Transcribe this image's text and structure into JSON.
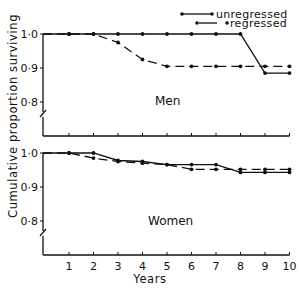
{
  "chart_data": [
    {
      "type": "line",
      "title": "Men",
      "xlabel": "Years",
      "ylabel": "Cumulative proportion surviving",
      "x": [
        1,
        2,
        3,
        4,
        5,
        6,
        7,
        8,
        9,
        10
      ],
      "xticks": [
        "1",
        "2",
        "3",
        "4",
        "5",
        "6",
        "7",
        "8",
        "9",
        "10"
      ],
      "yticks": [
        "0·8",
        "0·9",
        "1·0"
      ],
      "ylim": [
        0.8,
        1.0
      ],
      "axis_break": true,
      "grid": false,
      "series": [
        {
          "name": "unregressed",
          "style": "solid",
          "values": [
            1.0,
            1.0,
            1.0,
            1.0,
            1.0,
            1.0,
            1.0,
            1.0,
            0.885,
            0.885
          ]
        },
        {
          "name": "regressed",
          "style": "dash-dot",
          "values": [
            1.0,
            1.0,
            0.975,
            0.925,
            0.905,
            0.905,
            0.905,
            0.905,
            0.905,
            0.905
          ]
        }
      ]
    },
    {
      "type": "line",
      "title": "Women",
      "xlabel": "Years",
      "ylabel": "Cumulative proportion surviving",
      "x": [
        1,
        2,
        3,
        4,
        5,
        6,
        7,
        8,
        9,
        10
      ],
      "xticks": [
        "1",
        "2",
        "3",
        "4",
        "5",
        "6",
        "7",
        "8",
        "9",
        "10"
      ],
      "yticks": [
        "0·8",
        "0·9",
        "1·0"
      ],
      "ylim": [
        0.8,
        1.0
      ],
      "axis_break": true,
      "grid": false,
      "series": [
        {
          "name": "unregressed",
          "style": "solid",
          "values": [
            1.0,
            1.0,
            0.978,
            0.975,
            0.966,
            0.966,
            0.966,
            0.943,
            0.943,
            0.943
          ]
        },
        {
          "name": "regressed",
          "style": "dash-dot",
          "values": [
            1.0,
            0.985,
            0.975,
            0.97,
            0.966,
            0.952,
            0.952,
            0.952,
            0.952,
            0.952
          ]
        }
      ]
    }
  ],
  "legend": {
    "position": "top-right",
    "entries": [
      {
        "label": "unregressed",
        "style": "solid"
      },
      {
        "label": "regressed",
        "style": "dash-dot"
      }
    ]
  },
  "labels": {
    "y_axis_title": "Cumulative proportion surviving",
    "x_axis_title": "Years",
    "panel_men": "Men",
    "panel_women": "Women"
  }
}
